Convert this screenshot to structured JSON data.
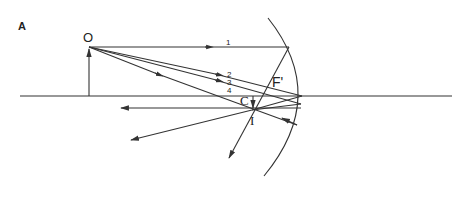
{
  "figure": {
    "panel_label": "A",
    "labels": {
      "object": "O",
      "focus": "F'",
      "center": "C",
      "image": "I"
    },
    "rays": [
      {
        "id": "1",
        "label": "1",
        "description": "parallel to axis, reflects through F'"
      },
      {
        "id": "2",
        "label": "2",
        "description": "ray toward mirror above axis"
      },
      {
        "id": "3",
        "label": "3",
        "description": "ray toward mirror vertex"
      },
      {
        "id": "4",
        "label": "4",
        "description": "ray through C"
      }
    ],
    "colors": {
      "line": "#333333",
      "text": "#222222",
      "background": "#ffffff"
    }
  }
}
